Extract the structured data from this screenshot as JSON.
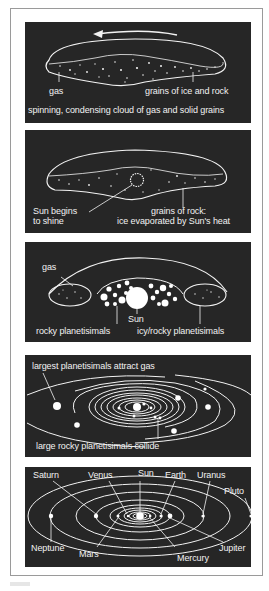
{
  "figure": {
    "background": "#ffffff",
    "panel_color": "#262626",
    "line_color": "#f2f2f2",
    "panels": [
      {
        "id": "stage-1",
        "labels": {
          "gas": "gas",
          "grains": "grains of ice and rock",
          "caption": "spinning, condensing cloud of gas and solid grains"
        },
        "icons": [
          "rotation-arrow-icon"
        ]
      },
      {
        "id": "stage-2",
        "labels": {
          "sun_line1": "Sun begins",
          "sun_line2": "to shine",
          "rock_line1": "grains of rock:",
          "rock_line2": "ice evaporated by Sun's heat"
        }
      },
      {
        "id": "stage-3",
        "labels": {
          "gas": "gas",
          "sun": "Sun",
          "rocky": "rocky planetisimals",
          "icy": "icy/rocky planetisimals"
        }
      },
      {
        "id": "stage-4",
        "labels": {
          "top": "largest planetisimals attract gas",
          "bottom": "large rocky planetisimals collide"
        }
      },
      {
        "id": "stage-5",
        "labels": {
          "saturn": "Saturn",
          "venus": "Venus",
          "sun": "Sun",
          "earth": "Earth",
          "uranus": "Uranus",
          "pluto": "Pluto",
          "neptune": "Neptune",
          "mars": "Mars",
          "mercury": "Mercury",
          "jupiter": "Jupiter"
        }
      }
    ]
  }
}
